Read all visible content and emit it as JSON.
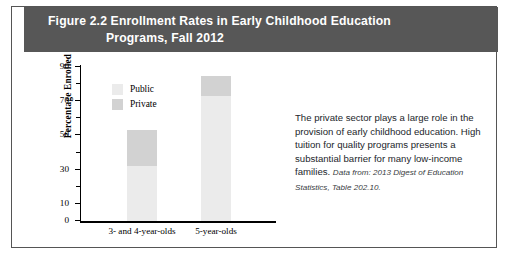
{
  "figure": {
    "header_line1": "Figure 2.2  Enrollment Rates in Early Childhood Education",
    "header_line2": "Programs, Fall 2012",
    "header_bg": "#575757",
    "header_text_color": "#ffffff",
    "border_color": "#555555"
  },
  "commentary": {
    "paragraph": "The private sector plays a large role in the provision of early childhood education. High tuition for quality programs presents a substantial barrier for many low-income families.",
    "citation_label": "Data from:",
    "citation_source": "2013 Digest of Education Statistics, Table 202.10."
  },
  "chart_data": {
    "type": "bar",
    "subtype": "stacked",
    "title": "Enrollment Rates in Early Childhood Education Programs, Fall 2012",
    "xlabel": "",
    "ylabel": "Percentage Enrolled",
    "categories": [
      "3- and 4-year-olds",
      "5-year-olds"
    ],
    "series": [
      {
        "name": "Public",
        "color": "#ebebeb",
        "values": [
          32,
          73
        ]
      },
      {
        "name": "Private",
        "color": "#d2d2d2",
        "values": [
          21,
          12
        ]
      }
    ],
    "totals": [
      53,
      85
    ],
    "ylim": [
      0,
      90
    ],
    "ytick_major": [
      0,
      10,
      30,
      50,
      70,
      90
    ],
    "ytick_minor": [
      20,
      40,
      60,
      80
    ],
    "ytick_labels": [
      "0",
      "10",
      "30",
      "50",
      "70",
      "90"
    ],
    "grid": false,
    "legend_position": "upper-left-inside",
    "legend_entries": [
      "Public",
      "Private"
    ]
  }
}
